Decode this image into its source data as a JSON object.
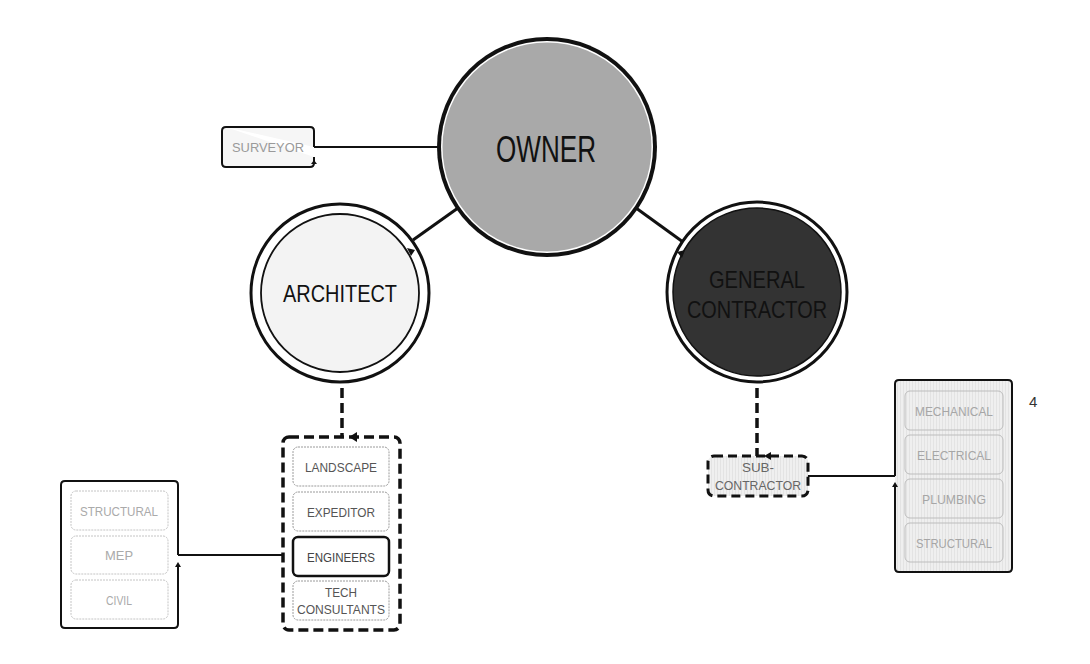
{
  "diagram": {
    "page_number": "4",
    "colors": {
      "owner_fill": "#a9a9a9",
      "architect_fill": "#f3f3f3",
      "gc_fill": "#333333",
      "item_fill": "#ededed",
      "item_border": "#b8b8b8",
      "item_text": "#a6a6a6",
      "active_text": "#555555",
      "stroke": "#111111"
    },
    "nodes": {
      "owner": {
        "label": "OWNER"
      },
      "architect": {
        "label": "ARCHITECT"
      },
      "general_contractor": {
        "label_line1": "GENERAL",
        "label_line2": "CONTRACTOR"
      },
      "surveyor": {
        "label": "SURVEYOR"
      },
      "subcontractor": {
        "label_line1": "SUB-",
        "label_line2": "CONTRACTOR"
      }
    },
    "architect_consultants": [
      {
        "label": "LANDSCAPE"
      },
      {
        "label": "EXPEDITOR"
      },
      {
        "label": "ENGINEERS",
        "highlighted": true
      },
      {
        "label_line1": "TECH",
        "label_line2": "CONSULTANTS"
      }
    ],
    "engineer_disciplines": [
      {
        "label": "STRUCTURAL"
      },
      {
        "label": "MEP"
      },
      {
        "label": "CIVIL"
      }
    ],
    "subcontractor_trades": [
      {
        "label": "MECHANICAL"
      },
      {
        "label": "ELECTRICAL"
      },
      {
        "label": "PLUMBING"
      },
      {
        "label": "STRUCTURAL"
      }
    ]
  }
}
